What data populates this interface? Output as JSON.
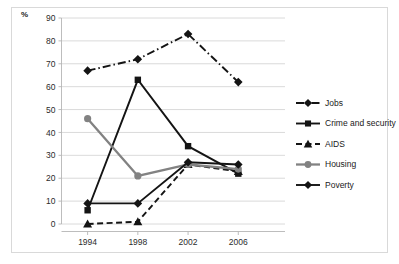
{
  "figure": {
    "axis_unit_label": "%"
  },
  "chart_data": {
    "type": "line",
    "title": "",
    "xlabel": "",
    "ylabel": "%",
    "x": [
      1994,
      1998,
      2002,
      2006
    ],
    "categories": [
      "1994",
      "1998",
      "2002",
      "2006"
    ],
    "xtick_labels": [
      "1994",
      "1998",
      "2002",
      "2006"
    ],
    "ytick_labels": [
      "0",
      "10",
      "20",
      "30",
      "40",
      "50",
      "60",
      "70",
      "80",
      "90"
    ],
    "yticks": [
      0,
      10,
      20,
      30,
      40,
      50,
      60,
      70,
      80,
      90
    ],
    "ylim": [
      0,
      90
    ],
    "grid": "horizontal",
    "legend_position": "right",
    "series": [
      {
        "name": "Jobs",
        "values": [
          67,
          72,
          83,
          62
        ],
        "color": "#141414",
        "marker": "diamond",
        "dash": "dash-dot"
      },
      {
        "name": "Crime and security",
        "values": [
          6,
          63,
          34,
          22
        ],
        "color": "#141414",
        "marker": "square",
        "dash": "solid"
      },
      {
        "name": "AIDS",
        "values": [
          0,
          1,
          26,
          23
        ],
        "color": "#141414",
        "marker": "triangle",
        "dash": "dashed"
      },
      {
        "name": "Housing",
        "values": [
          46,
          21,
          26,
          24
        ],
        "color": "#828282",
        "marker": "circle",
        "dash": "solid"
      },
      {
        "name": "Poverty",
        "values": [
          9,
          9,
          27,
          26
        ],
        "color": "#141414",
        "marker": "diamond",
        "dash": "solid"
      }
    ]
  }
}
